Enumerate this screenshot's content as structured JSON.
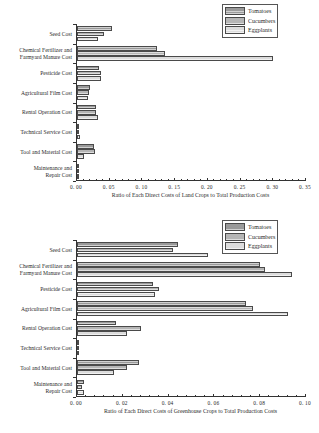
{
  "legend": {
    "position": "top-right",
    "entries": [
      {
        "label": "Tomatoes",
        "color": "#9a9a9a"
      },
      {
        "label": "Cucumbers",
        "color": "#b5b5b5"
      },
      {
        "label": "Eggplants",
        "color": "#dcdcdc"
      }
    ]
  },
  "chart_data": [
    {
      "type": "bar",
      "orientation": "horizontal",
      "title": "",
      "xlabel": "Ratio of Each Direct Costs of Land Crops to Total Production Costs",
      "ylabel": "",
      "xlim": [
        0.0,
        0.35
      ],
      "xticks": [
        0.0,
        0.05,
        0.1,
        0.15,
        0.2,
        0.25,
        0.3,
        0.35
      ],
      "xticklabels": [
        "0. 00",
        "0. 05",
        "0. 10",
        "0. 15",
        "0. 20",
        "0. 25",
        "0. 30",
        "0. 35"
      ],
      "grid": false,
      "legend_position": "upper right",
      "categories": [
        "Seed Cost",
        "Chemical Fertilizer and Farmyard Manure Cost",
        "Pesticide Cost",
        "Agricultural Film Cost",
        "Rental Operation Cost",
        "Technical Service Cost",
        "Tool and Material Cost",
        "Maintenance and Repair Cost"
      ],
      "series": [
        {
          "name": "Tomatoes",
          "values": [
            0.053,
            0.123,
            0.033,
            0.02,
            0.029,
            0.002,
            0.026,
            0.001
          ]
        },
        {
          "name": "Cucumbers",
          "values": [
            0.042,
            0.135,
            0.037,
            0.018,
            0.029,
            0.001,
            0.027,
            0.001
          ]
        },
        {
          "name": "Eggplants",
          "values": [
            0.032,
            0.3,
            0.037,
            0.017,
            0.032,
            0.004,
            0.01,
            0.001
          ]
        }
      ]
    },
    {
      "type": "bar",
      "orientation": "horizontal",
      "title": "",
      "xlabel": "Ratio of Each Direct Costs of Greenhouse Crops to Total Production Costs",
      "ylabel": "",
      "xlim": [
        0.0,
        0.1
      ],
      "xticks": [
        0.0,
        0.02,
        0.04,
        0.06,
        0.08,
        0.1
      ],
      "xticklabels": [
        "0. 00",
        "0. 02",
        "0. 04",
        "0. 06",
        "0. 08",
        "0. 10"
      ],
      "grid": false,
      "legend_position": "upper right",
      "categories": [
        "Seed Cost",
        "Chemical Fertilizer and Farmyard Manure Cost",
        "Pesticide Cost",
        "Agricultural Film Cost",
        "Rental Operation Cost",
        "Technical Service Cost",
        "Tool and Material Cost",
        "Maintenance and Repair Cost"
      ],
      "series": [
        {
          "name": "Tomatoes",
          "values": [
            0.044,
            0.08,
            0.033,
            0.074,
            0.017,
            0.001,
            0.027,
            0.003
          ]
        },
        {
          "name": "Cucumbers",
          "values": [
            0.042,
            0.082,
            0.036,
            0.077,
            0.028,
            0.001,
            0.022,
            0.002
          ]
        },
        {
          "name": "Eggplants",
          "values": [
            0.057,
            0.094,
            0.034,
            0.092,
            0.022,
            0.001,
            0.016,
            0.003
          ]
        }
      ]
    }
  ]
}
